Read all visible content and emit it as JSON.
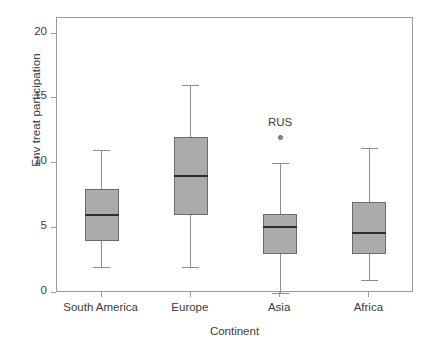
{
  "chart_data": {
    "type": "box",
    "title": "",
    "xlabel": "Continent",
    "ylabel": "Env treat participation",
    "categories": [
      "South America",
      "Europe",
      "Asia",
      "Africa"
    ],
    "ylim": [
      0,
      21.2
    ],
    "yticks": [
      0,
      5,
      10,
      15,
      20
    ],
    "ytick_labels": [
      "0",
      "5",
      "10",
      "15",
      "20"
    ],
    "grid": false,
    "legend": "none",
    "boxes": [
      {
        "category": "South America",
        "whisker_low": 2.0,
        "q1": 4.0,
        "median": 6.0,
        "q3": 8.0,
        "whisker_high": 11.0,
        "outliers": []
      },
      {
        "category": "Europe",
        "whisker_low": 2.0,
        "q1": 6.0,
        "median": 9.0,
        "q3": 12.0,
        "whisker_high": 16.0,
        "outliers": []
      },
      {
        "category": "Asia",
        "whisker_low": 0.0,
        "q1": 3.0,
        "median": 5.1,
        "q3": 6.1,
        "whisker_high": 10.0,
        "outliers": [
          {
            "label": "RUS",
            "value": 12.0
          }
        ]
      },
      {
        "category": "Africa",
        "whisker_low": 1.0,
        "q1": 3.0,
        "median": 4.6,
        "q3": 7.0,
        "whisker_high": 11.2,
        "outliers": []
      }
    ],
    "colors": {
      "box_fill": "#ababab",
      "box_stroke": "#6a6a6a",
      "median": "#2e2e2e",
      "whisker": "#8d8d8d",
      "frame": "#9a9a9a",
      "text": "#3c3c3c",
      "background": "#ffffff"
    }
  }
}
